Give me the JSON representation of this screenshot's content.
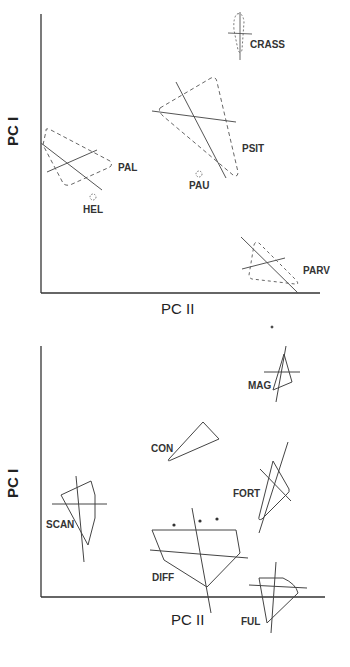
{
  "top_panel": {
    "x_axis_label": "PC II",
    "y_axis_label": "PC I",
    "line_style": "dashed",
    "groups": [
      {
        "label": "CRASS"
      },
      {
        "label": "PSIT"
      },
      {
        "label": "PAL"
      },
      {
        "label": "PAU"
      },
      {
        "label": "HEL"
      },
      {
        "label": "PARV"
      }
    ]
  },
  "bottom_panel": {
    "x_axis_label": "PC II",
    "y_axis_label": "PC I",
    "line_style": "solid",
    "groups": [
      {
        "label": "MAG"
      },
      {
        "label": "CON"
      },
      {
        "label": "FORT"
      },
      {
        "label": "SCAN"
      },
      {
        "label": "DIFF"
      },
      {
        "label": "FUL"
      }
    ]
  },
  "colors": {
    "ink": "#333333",
    "background": "#ffffff"
  }
}
